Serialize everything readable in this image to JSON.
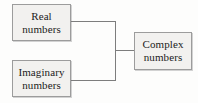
{
  "diagram": {
    "type": "concept-map",
    "nodes": [
      {
        "id": "real",
        "label": "Real\nnumbers"
      },
      {
        "id": "imaginary",
        "label": "Imaginary\nnumbers"
      },
      {
        "id": "complex",
        "label": "Complex\nnumbers"
      }
    ],
    "edges": [
      {
        "from": "real",
        "to": "complex"
      },
      {
        "from": "imaginary",
        "to": "complex"
      }
    ],
    "colors": {
      "background": "#fdfdfc",
      "box_fill": "#f2f1ef",
      "box_border": "#9c9c9c",
      "line": "#7d7d7d",
      "text": "#1b1b1b"
    }
  }
}
